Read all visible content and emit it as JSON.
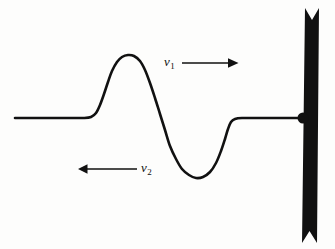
{
  "figure": {
    "background_color": "#fdfdfc",
    "ink_color": "#111111",
    "width": 335,
    "height": 249
  },
  "labels": {
    "v1": {
      "symbol": "v",
      "subscript": "1",
      "meaning": "incident-pulse-velocity"
    },
    "v2": {
      "symbol": "v",
      "subscript": "2",
      "meaning": "reflected-pulse-velocity"
    }
  },
  "arrows": {
    "v1_arrow": {
      "direction": "right",
      "x_start": 182,
      "x_end": 237,
      "y": 63,
      "color": "#111111"
    },
    "v2_arrow": {
      "direction": "left",
      "x_start": 137,
      "x_end": 78,
      "y": 169,
      "color": "#111111"
    }
  },
  "chart_data": {
    "type": "line",
    "xlabel": "",
    "ylabel": "",
    "grid": false,
    "legend": "none",
    "xlim": [
      0,
      335
    ],
    "ylim": [
      249,
      0
    ],
    "baseline_y": 118,
    "series": [
      {
        "name": "string-pulse",
        "stroke_color": "#111111",
        "stroke_width": 2.6,
        "points": [
          [
            15,
            118
          ],
          [
            40,
            118
          ],
          [
            65,
            118
          ],
          [
            84,
            118
          ],
          [
            91,
            117
          ],
          [
            96,
            113
          ],
          [
            100,
            105
          ],
          [
            104,
            94
          ],
          [
            108,
            82
          ],
          [
            112,
            71
          ],
          [
            117,
            62
          ],
          [
            122,
            57
          ],
          [
            128,
            55
          ],
          [
            134,
            56
          ],
          [
            140,
            61
          ],
          [
            145,
            70
          ],
          [
            150,
            83
          ],
          [
            155,
            98
          ],
          [
            160,
            114
          ],
          [
            165,
            130
          ],
          [
            170,
            146
          ],
          [
            176,
            159
          ],
          [
            182,
            169
          ],
          [
            189,
            175
          ],
          [
            196,
            178
          ],
          [
            203,
            177
          ],
          [
            210,
            172
          ],
          [
            216,
            163
          ],
          [
            221,
            151
          ],
          [
            225,
            139
          ],
          [
            228,
            129
          ],
          [
            231,
            122
          ],
          [
            235,
            119
          ],
          [
            242,
            118
          ],
          [
            260,
            118
          ],
          [
            285,
            118
          ],
          [
            303,
            118
          ]
        ],
        "features": {
          "crest_peak": {
            "x": 128,
            "y": 55,
            "amplitude": 63
          },
          "trough_bottom": {
            "x": 197,
            "y": 178,
            "amplitude": -60
          },
          "left_flat_span": [
            15,
            88
          ],
          "right_flat_span": [
            236,
            303
          ]
        }
      }
    ],
    "annotations": [
      {
        "name": "v1",
        "text": "v1",
        "x": 170,
        "y": 62,
        "arrow": "right"
      },
      {
        "name": "v2",
        "text": "v2",
        "x": 148,
        "y": 168,
        "arrow": "left"
      }
    ]
  },
  "wall": {
    "name": "fixed-end-wall",
    "fill_color": "#111111",
    "x_left_top": 305,
    "x_right_top": 319,
    "x_left_bottom": 302,
    "x_right_bottom": 317,
    "y_top": 8,
    "y_bottom": 243,
    "notch_depth": 16,
    "attachment_point": {
      "x": 303,
      "y": 118,
      "radius": 5.5
    }
  }
}
